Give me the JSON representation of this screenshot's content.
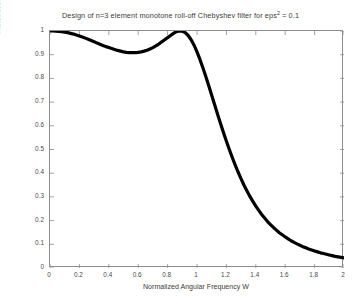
{
  "chart_data": {
    "type": "line",
    "title": "Design of n=3 element monotone roll-off Chebyshev filter for eps2 = 0.1",
    "title_prefix": "Design of n=3 element monotone roll-off Chebyshev filter for eps",
    "title_exponent": "2",
    "title_suffix": " = 0.1",
    "xlabel": "Normalized Angular Frequency W",
    "ylabel": "Transducer Power Gain",
    "xlim": [
      0,
      2
    ],
    "ylim": [
      0,
      1
    ],
    "grid": false,
    "legend": null,
    "line_color": "#000000",
    "line_style": "dotted-thick-markers",
    "xticks": [
      "0",
      "0.2",
      "0.4",
      "0.6",
      "0.8",
      "1",
      "1.2",
      "1.4",
      "1.6",
      "1.8",
      "2"
    ],
    "xtick_values": [
      0,
      0.2,
      0.4,
      0.6,
      0.8,
      1,
      1.2,
      1.4,
      1.6,
      1.8,
      2
    ],
    "yticks": [
      "0",
      "0.1",
      "0.2",
      "0.3",
      "0.4",
      "0.5",
      "0.6",
      "0.7",
      "0.8",
      "0.9",
      "1"
    ],
    "ytick_values": [
      0,
      0.1,
      0.2,
      0.3,
      0.4,
      0.5,
      0.6,
      0.7,
      0.8,
      0.9,
      1
    ],
    "series": [
      {
        "name": "Transducer Power Gain",
        "x": [
          0.0,
          0.02,
          0.04,
          0.06,
          0.08,
          0.1,
          0.12,
          0.14,
          0.16,
          0.18,
          0.2,
          0.22,
          0.24,
          0.26,
          0.28,
          0.3,
          0.32,
          0.34,
          0.36,
          0.38,
          0.4,
          0.42,
          0.44,
          0.46,
          0.48,
          0.5,
          0.52,
          0.54,
          0.56,
          0.58,
          0.6,
          0.62,
          0.64,
          0.66,
          0.68,
          0.7,
          0.72,
          0.74,
          0.76,
          0.78,
          0.8,
          0.82,
          0.84,
          0.86,
          0.88,
          0.9,
          0.92,
          0.94,
          0.96,
          0.98,
          1.0,
          1.02,
          1.04,
          1.06,
          1.08,
          1.1,
          1.12,
          1.14,
          1.16,
          1.18,
          1.2,
          1.22,
          1.24,
          1.26,
          1.28,
          1.3,
          1.32,
          1.34,
          1.36,
          1.38,
          1.4,
          1.42,
          1.44,
          1.46,
          1.48,
          1.5,
          1.52,
          1.54,
          1.56,
          1.58,
          1.6,
          1.62,
          1.64,
          1.66,
          1.68,
          1.7,
          1.72,
          1.74,
          1.76,
          1.78,
          1.8,
          1.82,
          1.84,
          1.86,
          1.88,
          1.9,
          1.92,
          1.94,
          1.96,
          1.98,
          2.0
        ],
        "y": [
          1.0,
          1.0,
          0.999,
          0.998,
          0.997,
          0.995,
          0.993,
          0.99,
          0.987,
          0.983,
          0.979,
          0.975,
          0.97,
          0.965,
          0.96,
          0.955,
          0.949,
          0.944,
          0.939,
          0.934,
          0.93,
          0.926,
          0.922,
          0.918,
          0.915,
          0.912,
          0.91,
          0.909,
          0.909,
          0.909,
          0.91,
          0.912,
          0.915,
          0.919,
          0.924,
          0.93,
          0.937,
          0.945,
          0.954,
          0.963,
          0.972,
          0.981,
          0.99,
          0.997,
          1.0,
          0.999,
          0.993,
          0.981,
          0.963,
          0.94,
          0.912,
          0.88,
          0.845,
          0.808,
          0.769,
          0.729,
          0.689,
          0.649,
          0.61,
          0.572,
          0.535,
          0.5,
          0.466,
          0.434,
          0.404,
          0.376,
          0.349,
          0.325,
          0.302,
          0.281,
          0.261,
          0.243,
          0.226,
          0.211,
          0.196,
          0.183,
          0.171,
          0.16,
          0.149,
          0.14,
          0.131,
          0.123,
          0.115,
          0.108,
          0.102,
          0.096,
          0.09,
          0.085,
          0.08,
          0.076,
          0.072,
          0.068,
          0.064,
          0.061,
          0.058,
          0.055,
          0.052,
          0.049,
          0.047,
          0.045,
          0.043
        ]
      }
    ],
    "passband_ripple_min": 0.909,
    "passband_peak_w": 0.88,
    "value_at_w2": 0.043
  }
}
